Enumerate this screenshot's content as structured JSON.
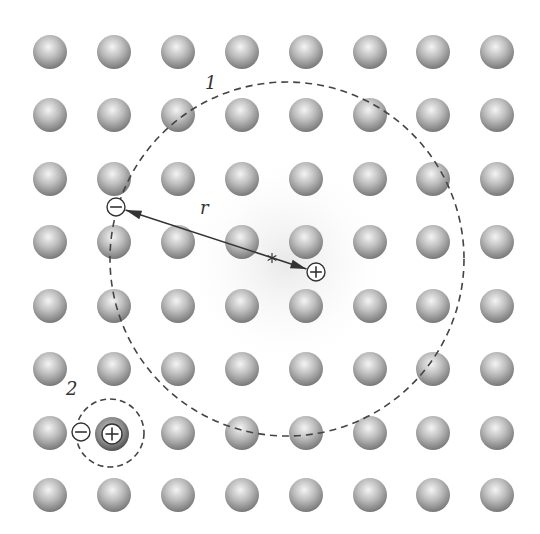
{
  "lattice": {
    "columns_x": [
      50,
      114,
      178,
      242,
      306,
      370,
      433,
      497
    ],
    "rows_y": [
      52,
      115,
      179,
      242,
      306,
      369,
      433,
      495
    ],
    "sphere_radius": 17,
    "sphere_color_light": "#f2f2f2",
    "sphere_color_dark": "#7a7a7a"
  },
  "exciton_large": {
    "label": "1",
    "center": [
      287,
      259
    ],
    "radius": 177,
    "electron": {
      "symbol": "minus",
      "x": 116,
      "y": 207
    },
    "hole": {
      "symbol": "plus",
      "x": 316,
      "y": 272
    },
    "separation_label": "r",
    "midpoint_marker": "*"
  },
  "exciton_small": {
    "label": "2",
    "center": [
      110,
      433
    ],
    "radius": 34,
    "electron": {
      "symbol": "minus",
      "x": 81,
      "y": 432
    },
    "hole": {
      "symbol": "plus",
      "x": 112,
      "y": 434
    }
  },
  "colors": {
    "dashed_line": "#444444",
    "arrow": "#333333",
    "glow": "#e9e9e9"
  }
}
